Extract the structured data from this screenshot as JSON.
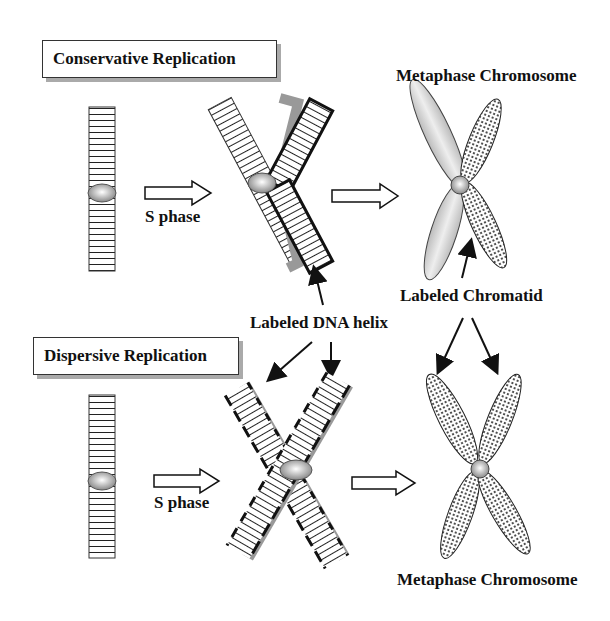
{
  "top": {
    "title": "Conservative Replication",
    "s_phase": "S phase",
    "metaphase_label": "Metaphase Chromosome",
    "chromatid_label": "Labeled Chromatid"
  },
  "middle": {
    "dna_helix_label": "Labeled DNA helix"
  },
  "bottom": {
    "title": "Dispersive Replication",
    "s_phase": "S phase",
    "metaphase_label": "Metaphase Chromosome"
  },
  "colors": {
    "stroke": "#111111",
    "shadow_gray": "#999999",
    "chromatid_light": "#d8d8d8",
    "centromere": "#c8c8c8"
  }
}
